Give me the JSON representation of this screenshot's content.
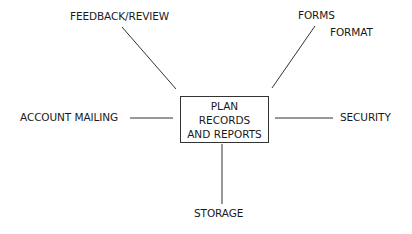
{
  "center": {
    "lines": [
      "PLAN",
      "RECORDS",
      "AND REPORTS"
    ]
  },
  "nodes": {
    "feedback": "FEEDBACK/REVIEW",
    "forms": "FORMS",
    "format": "FORMAT",
    "account_mailing": "ACCOUNT MAILING",
    "security": "SECURITY",
    "storage": "STORAGE"
  },
  "colors": {
    "line": "#333333",
    "text": "#1a1a1a",
    "background": "#ffffff"
  }
}
